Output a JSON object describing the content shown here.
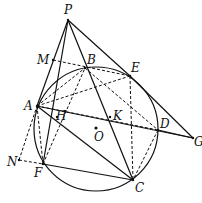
{
  "diagram": {
    "type": "geometry",
    "circle": {
      "center": "O",
      "cx": 96,
      "cy": 129,
      "r": 62
    },
    "points": [
      {
        "name": "P",
        "x": 68,
        "y": 20,
        "lx": 64,
        "ly": 14
      },
      {
        "name": "M",
        "x": 53,
        "y": 60,
        "lx": 37,
        "ly": 64
      },
      {
        "name": "B",
        "x": 85,
        "y": 68,
        "lx": 87,
        "ly": 64
      },
      {
        "name": "E",
        "x": 130,
        "y": 76,
        "lx": 131,
        "ly": 72
      },
      {
        "name": "A",
        "x": 37,
        "y": 106,
        "lx": 24,
        "ly": 110
      },
      {
        "name": "H",
        "x": 57,
        "y": 117,
        "lx": 56,
        "ly": 120
      },
      {
        "name": "K",
        "x": 110,
        "y": 117,
        "lx": 113,
        "ly": 120
      },
      {
        "name": "O",
        "x": 96,
        "y": 128,
        "lx": 94,
        "ly": 141
      },
      {
        "name": "D",
        "x": 158,
        "y": 130,
        "lx": 160,
        "ly": 128
      },
      {
        "name": "G",
        "x": 193,
        "y": 138,
        "lx": 194,
        "ly": 146
      },
      {
        "name": "N",
        "x": 19,
        "y": 160,
        "lx": 7,
        "ly": 166
      },
      {
        "name": "F",
        "x": 43,
        "y": 164,
        "lx": 34,
        "ly": 177
      },
      {
        "name": "C",
        "x": 133,
        "y": 180,
        "lx": 135,
        "ly": 192
      }
    ],
    "solid_segments": [
      [
        "P",
        "A"
      ],
      [
        "P",
        "F"
      ],
      [
        "P",
        "C"
      ],
      [
        "P",
        "E"
      ],
      [
        "E",
        "G"
      ],
      [
        "A",
        "G"
      ],
      [
        "A",
        "C"
      ],
      [
        "F",
        "C"
      ],
      [
        "D",
        "G"
      ]
    ],
    "dashed_segments": [
      [
        "M",
        "E"
      ],
      [
        "B",
        "D"
      ],
      [
        "A",
        "B"
      ],
      [
        "A",
        "E"
      ],
      [
        "A",
        "D"
      ],
      [
        "A",
        "F"
      ],
      [
        "E",
        "C"
      ],
      [
        "D",
        "C"
      ],
      [
        "N",
        "A"
      ],
      [
        "N",
        "F"
      ],
      [
        "F",
        "B"
      ]
    ]
  }
}
